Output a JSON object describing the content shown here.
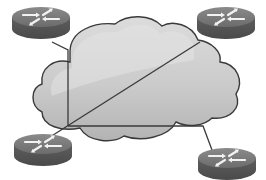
{
  "diagram": {
    "type": "network-topology",
    "background": "#ffffff",
    "cloud": {
      "label": "",
      "fill_light": "#d6d6d6",
      "fill_dark": "#b9b9b9",
      "stroke": "#3a3a3a"
    },
    "routers": [
      {
        "id": "router-top-left",
        "position": "top-left"
      },
      {
        "id": "router-top-right",
        "position": "top-right"
      },
      {
        "id": "router-bottom-left",
        "position": "bottom-left"
      },
      {
        "id": "router-bottom-right",
        "position": "bottom-right"
      }
    ],
    "router_colors": {
      "top": "#7a7a7a",
      "side": "#5a5a5a",
      "arrows": "#f2f2f2"
    },
    "links": [
      {
        "from": "router-top-left",
        "to": "hub"
      },
      {
        "from": "router-top-right",
        "to": "router-bottom-left"
      },
      {
        "from": "hub",
        "to": "router-bottom-right"
      },
      {
        "from": "hub",
        "to": "router-bottom-left"
      }
    ],
    "link_color": "#3a3a3a"
  }
}
